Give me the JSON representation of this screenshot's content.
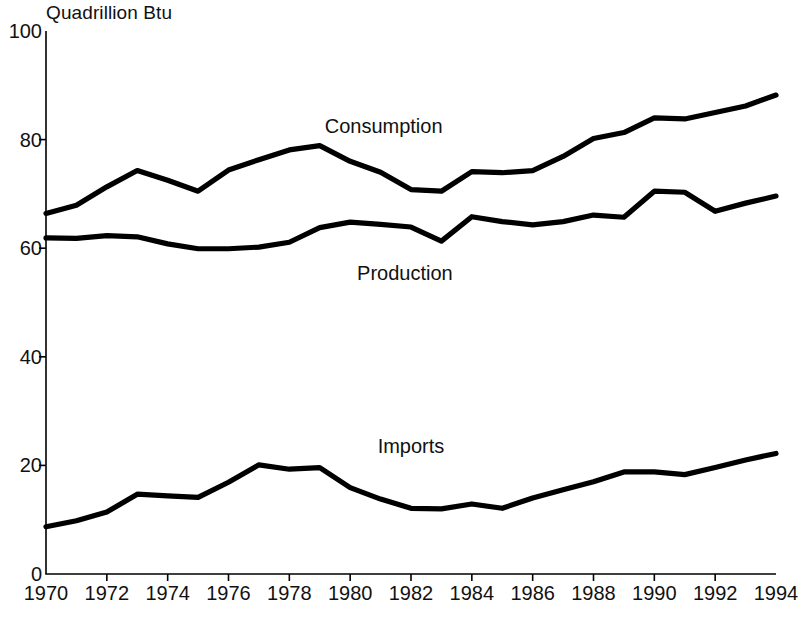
{
  "chart_data": {
    "type": "line",
    "title": "",
    "subtitle": "",
    "unit_label": "Quadrillion Btu",
    "xlabel": "",
    "ylabel": "Quadrillion Btu",
    "xlim": [
      1970,
      1994
    ],
    "ylim": [
      0,
      100
    ],
    "grid": false,
    "legend_position": "inline-annotations",
    "y_ticks": [
      0,
      20,
      40,
      60,
      80,
      100
    ],
    "y_tick_labels": [
      "0",
      "20",
      "40",
      "60",
      "80",
      "100"
    ],
    "x_ticks": [
      1970,
      1972,
      1974,
      1976,
      1978,
      1980,
      1982,
      1984,
      1986,
      1988,
      1990,
      1992,
      1994
    ],
    "x_tick_labels": [
      "1970",
      "1972",
      "1974",
      "1976",
      "1978",
      "1980",
      "1982",
      "1984",
      "1986",
      "1988",
      "1990",
      "1992",
      "1994"
    ],
    "x": [
      1970,
      1971,
      1972,
      1973,
      1974,
      1975,
      1976,
      1977,
      1978,
      1979,
      1980,
      1981,
      1982,
      1983,
      1984,
      1985,
      1986,
      1987,
      1988,
      1989,
      1990,
      1991,
      1992,
      1993,
      1994
    ],
    "series": [
      {
        "name": "Consumption",
        "color": "#000000",
        "label_x": 1981.1,
        "label_y": 82.5,
        "values": [
          66.4,
          67.9,
          71.3,
          74.3,
          72.5,
          70.5,
          74.4,
          76.3,
          78.1,
          78.9,
          76.0,
          74.0,
          70.8,
          70.5,
          74.1,
          73.9,
          74.3,
          76.9,
          80.2,
          81.3,
          84.0,
          83.8,
          85.0,
          86.2,
          88.2
        ]
      },
      {
        "name": "Production",
        "color": "#000000",
        "label_x": 1981.8,
        "label_y": 55.5,
        "values": [
          61.9,
          61.8,
          62.3,
          62.1,
          60.8,
          59.9,
          59.9,
          60.2,
          61.1,
          63.8,
          64.8,
          64.4,
          63.9,
          61.3,
          65.8,
          64.9,
          64.3,
          64.9,
          66.1,
          65.7,
          70.5,
          70.3,
          66.8,
          68.3,
          69.6
        ]
      },
      {
        "name": "Imports",
        "color": "#000000",
        "label_x": 1982.0,
        "label_y": 23.5,
        "values": [
          8.7,
          9.8,
          11.4,
          14.7,
          14.4,
          14.1,
          16.9,
          20.1,
          19.3,
          19.6,
          15.9,
          13.8,
          12.1,
          12.0,
          12.9,
          12.1,
          14.0,
          15.5,
          17.0,
          18.8,
          18.8,
          18.3,
          19.6,
          21.0,
          22.2
        ]
      }
    ]
  },
  "axes": {
    "unit_caption": "Quadrillion Btu"
  }
}
